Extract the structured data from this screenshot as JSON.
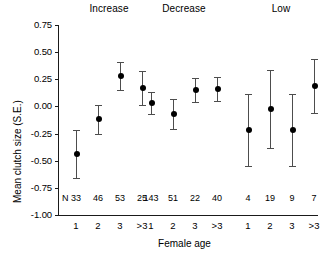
{
  "chart_data": {
    "type": "scatter",
    "title": "",
    "xlabel": "Female age",
    "ylabel": "Mean clutch size (S.E.)",
    "ylim": [
      -1.0,
      0.75
    ],
    "ytick_labels": [
      "0.75",
      "0.50",
      "0.25",
      "0.00",
      "-0.25",
      "-0.50",
      "-0.75",
      "-1.00"
    ],
    "ytick_values": [
      0.75,
      0.5,
      0.25,
      0.0,
      -0.25,
      -0.5,
      -0.75,
      -1.0
    ],
    "grid": false,
    "legend_position": "none",
    "n_row_symbol": "N",
    "categories": [
      "1",
      "2",
      "3",
      ">3"
    ],
    "panels": [
      {
        "label": "Increase",
        "categories": [
          "1",
          "2",
          "3",
          ">3"
        ],
        "values": [
          -0.44,
          -0.12,
          0.28,
          0.17
        ],
        "errors": [
          0.22,
          0.13,
          0.13,
          0.16
        ],
        "n": [
          33,
          46,
          53,
          25
        ]
      },
      {
        "label": "Decrease",
        "categories": [
          "1",
          "2",
          "3",
          ">3"
        ],
        "values": [
          0.03,
          -0.07,
          0.15,
          0.16
        ],
        "errors": [
          0.1,
          0.14,
          0.11,
          0.11
        ],
        "n": [
          143,
          51,
          22,
          40
        ]
      },
      {
        "label": "Low",
        "categories": [
          "1",
          "2",
          "3",
          ">3"
        ],
        "values": [
          -0.22,
          -0.02,
          -0.22,
          0.19
        ],
        "errors": [
          0.33,
          0.36,
          0.33,
          0.25
        ],
        "n": [
          4,
          19,
          9,
          7
        ]
      }
    ],
    "colors": {
      "marker": "#000000",
      "errorbar": "#4d4d4d",
      "axis": "#1a1a1a",
      "background": "#ffffff"
    }
  }
}
